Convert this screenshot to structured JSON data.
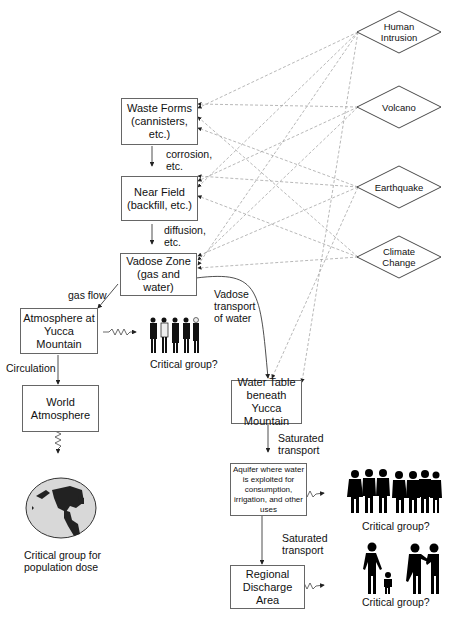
{
  "diagram": {
    "boxes": {
      "waste_forms": "Waste Forms (cannisters, etc.)",
      "waste_forms_l1": "Waste Forms",
      "waste_forms_l2": "(cannisters,",
      "waste_forms_l3": "etc.)",
      "near_field_l1": "Near Field",
      "near_field_l2": "(backfill, etc.)",
      "vadose_zone_l1": "Vadose Zone",
      "vadose_zone_l2": "(gas and water)",
      "atm_yucca_l1": "Atmosphere at",
      "atm_yucca_l2": "Yucca Mountain",
      "world_atm_l1": "World",
      "world_atm_l2": "Atmosphere",
      "water_table_l1": "Water Table",
      "water_table_l2": "beneath Yucca",
      "water_table_l3": "Mountain",
      "aquifer_l1": "Aquifer where water",
      "aquifer_l2": "is exploited for",
      "aquifer_l3": "consumption,",
      "aquifer_l4": "irrigation, and other",
      "aquifer_l5": "uses",
      "regional_l1": "Regional",
      "regional_l2": "Discharge Area"
    },
    "events": {
      "human_l1": "Human",
      "human_l2": "Intrusion",
      "volcano": "Volcano",
      "earthquake": "Earthquake",
      "climate_l1": "Climate",
      "climate_l2": "Change"
    },
    "edge_labels": {
      "corrosion_l1": "corrosion,",
      "corrosion_l2": "etc.",
      "diffusion_l1": "diffusion,",
      "diffusion_l2": "etc.",
      "gas_flow": "gas flow",
      "vadose_l1": "Vadose",
      "vadose_l2": "transport",
      "vadose_l3": "of water",
      "circulation": "Circulation",
      "sat1_l1": "Saturated",
      "sat1_l2": "transport",
      "sat2_l1": "Saturated",
      "sat2_l2": "transport"
    },
    "captions": {
      "critical_1": "Critical group?",
      "critical_2": "Critical group?",
      "critical_3": "Critical group?",
      "population_l1": "Critical group for",
      "population_l2": "population dose"
    }
  }
}
